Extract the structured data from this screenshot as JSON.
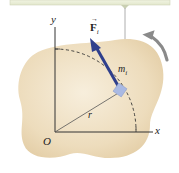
{
  "diagram": {
    "labels": {
      "y_axis": "y",
      "x_axis": "x",
      "origin": "O",
      "radius": "r",
      "mass": "m",
      "mass_subscript": "i",
      "force": "F",
      "force_subscript": "i"
    },
    "colors": {
      "body_fill": "#ecdcbf",
      "body_fill_light": "#f6ecd8",
      "force_arrow": "#2f3f8c",
      "mass_square": "#a9b9e3",
      "axes": "#333333",
      "rotation_arrow": "#888888",
      "top_bar": "#eef1dc",
      "top_bar_border": "#c9cfb2",
      "pivot_line": "#999999"
    },
    "elements": [
      "rigid-body",
      "coordinate-axes",
      "radius-line",
      "dashed-circular-path",
      "particle-mass",
      "force-vector",
      "rotation-direction-arrow",
      "pivot-support"
    ]
  }
}
